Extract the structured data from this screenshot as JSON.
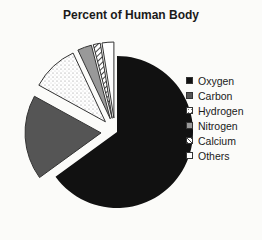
{
  "chart_data": {
    "type": "pie",
    "title": "Percent of Human Body",
    "categories": [
      "Oxygen",
      "Carbon",
      "Hydrogen",
      "Nitrogen",
      "Calcium",
      "Others"
    ],
    "values": [
      65,
      18,
      10,
      3,
      1.5,
      2.5
    ],
    "exploded": [
      false,
      true,
      true,
      true,
      true,
      true
    ],
    "legend_position": "right",
    "fills": [
      "#111111",
      "#555555",
      "dotted-white",
      "#999999",
      "hatched",
      "#ffffff"
    ]
  },
  "legend": {
    "items": [
      {
        "label": "Oxygen",
        "color": "#111111"
      },
      {
        "label": "Carbon",
        "color": "#555555"
      },
      {
        "label": "Hydrogen",
        "color": "#ffffff"
      },
      {
        "label": "Nitrogen",
        "color": "#999999"
      },
      {
        "label": "Calcium",
        "color": "#aaaaaa"
      },
      {
        "label": "Others",
        "color": "#ffffff"
      }
    ]
  }
}
